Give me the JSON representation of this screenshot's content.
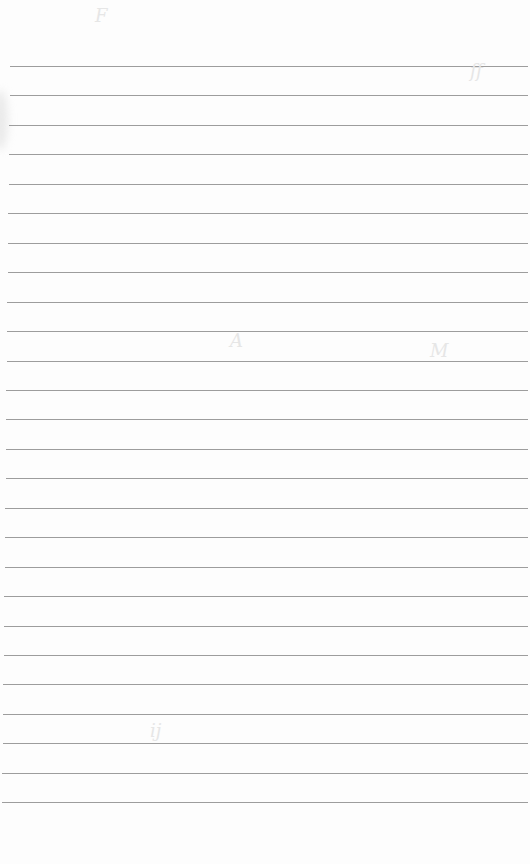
{
  "document": {
    "type": "ruled-paper",
    "background_color": "#fdfdfd",
    "rule_color": "#8c8c8c",
    "rule_count": 26,
    "first_rule_y": 66,
    "rule_spacing": 29.45,
    "rule_left_start": 10,
    "rule_left_end_bottom": 2,
    "rule_right": 528,
    "text_content": ""
  }
}
